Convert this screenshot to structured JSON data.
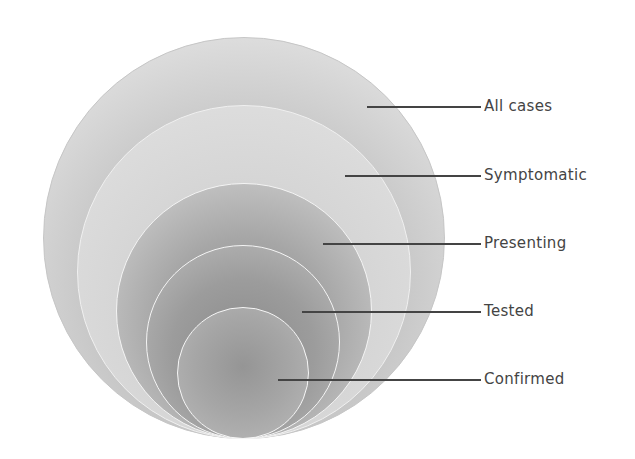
{
  "diagram": {
    "type": "nested-circles",
    "levels": [
      {
        "label": "All cases",
        "cx": 244,
        "bottom": 439,
        "r": 201,
        "line_y": 107,
        "line_x1": 367
      },
      {
        "label": "Symptomatic",
        "cx": 244,
        "bottom": 439,
        "r": 167,
        "line_y": 176,
        "line_x1": 345
      },
      {
        "label": "Presenting",
        "cx": 244,
        "bottom": 439,
        "r": 128,
        "line_y": 244,
        "line_x1": 323
      },
      {
        "label": "Tested",
        "cx": 243,
        "bottom": 439,
        "r": 97,
        "line_y": 312,
        "line_x1": 302
      },
      {
        "label": "Confirmed",
        "cx": 243,
        "bottom": 439,
        "r": 66,
        "line_y": 380,
        "line_x1": 278
      }
    ],
    "line_x2": 481,
    "label_x": 484,
    "colors": {
      "line": "#444444",
      "label": "#444444",
      "outer_border": "#c6c6c6",
      "inner_border": "#f4f4f4"
    }
  }
}
